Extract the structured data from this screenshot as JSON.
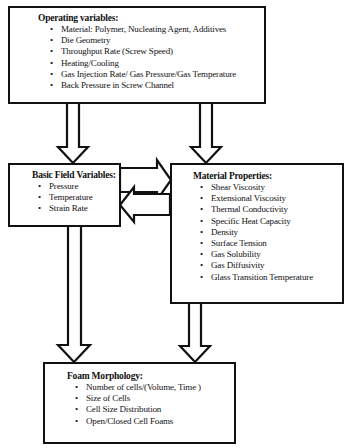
{
  "operating_variables": {
    "title": "Operating variables:",
    "items": [
      "Material: Polymer, Nucleating Agent, Additives",
      "Die Geometry",
      "Throughput Rate (Screw Speed)",
      "Heating/Cooling",
      "Gas Injection Rate/ Gas Pressure/Gas Temperature",
      "Back Pressure in Screw Channel"
    ]
  },
  "basic_field_variables": {
    "title": "Basic Field Variables:",
    "items": [
      "Pressure",
      "Temperature",
      "Strain Rate"
    ]
  },
  "material_properties": {
    "title": "Material Properties:",
    "items": [
      "Shear Viscosity",
      "Extensional Viscosity",
      "Thermal Conductivity",
      "Specific Heat Capacity",
      "Density",
      "Surface Tension",
      "Gas Solubility",
      "Gas Diffusivity",
      "Glass Transition Temperature"
    ]
  },
  "foam_morphology": {
    "title": "Foam Morphology:",
    "items": [
      "Number of cells/(Volume, Time )",
      "Size of Cells",
      "Cell Size Distribution",
      "Open/Closed Cell Foams"
    ]
  },
  "connections": [
    {
      "from": "operating_variables",
      "to": "basic_field_variables",
      "icon": "down-arrow-icon"
    },
    {
      "from": "operating_variables",
      "to": "material_properties",
      "icon": "down-arrow-icon"
    },
    {
      "from": "basic_field_variables",
      "to": "material_properties",
      "icon": "right-arrow-icon"
    },
    {
      "from": "material_properties",
      "to": "basic_field_variables",
      "icon": "left-arrow-icon"
    },
    {
      "from": "basic_field_variables",
      "to": "foam_morphology",
      "icon": "down-arrow-icon"
    },
    {
      "from": "material_properties",
      "to": "foam_morphology",
      "icon": "down-arrow-icon"
    }
  ]
}
